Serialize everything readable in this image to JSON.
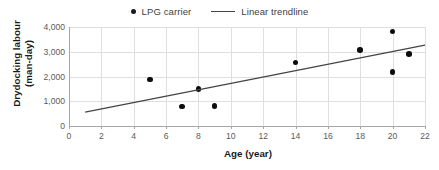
{
  "chart_data": {
    "type": "scatter",
    "title": "",
    "xlabel": "Age (year)",
    "ylabel": "Drydocking labour (man-day)",
    "ylabel_line1": "Drydocking labour",
    "ylabel_line2": "(man-day)",
    "xlim": [
      0,
      22
    ],
    "ylim": [
      0,
      4000
    ],
    "xticks": [
      0,
      2,
      4,
      6,
      8,
      10,
      12,
      14,
      16,
      18,
      20,
      22
    ],
    "xtick_labels": [
      "0",
      "2",
      "4",
      "6",
      "8",
      "10",
      "12",
      "14",
      "16",
      "18",
      "20",
      "22"
    ],
    "yticks": [
      0,
      1000,
      2000,
      3000,
      4000
    ],
    "ytick_labels": [
      "0",
      "1,000",
      "2,000",
      "3,000",
      "4,000"
    ],
    "grid": true,
    "legend_position": "top-center",
    "series": [
      {
        "name": "LPG carrier",
        "type": "scatter",
        "marker": "circle",
        "color": "#0d0d0d",
        "points": [
          {
            "x": 5,
            "y": 1880
          },
          {
            "x": 7,
            "y": 790
          },
          {
            "x": 8,
            "y": 1490
          },
          {
            "x": 9,
            "y": 800
          },
          {
            "x": 14,
            "y": 2560
          },
          {
            "x": 18,
            "y": 3060
          },
          {
            "x": 20,
            "y": 3820
          },
          {
            "x": 20,
            "y": 2190
          },
          {
            "x": 21,
            "y": 2900
          }
        ]
      },
      {
        "name": "Linear trendline",
        "type": "line",
        "color": "#444444",
        "endpoints": [
          {
            "x": 1,
            "y": 560
          },
          {
            "x": 22,
            "y": 3270
          }
        ]
      }
    ]
  },
  "legend": {
    "entries": [
      {
        "label": "LPG carrier",
        "marker": "dot"
      },
      {
        "label": "Linear trendline",
        "marker": "line"
      }
    ]
  },
  "colors": {
    "marker": "#0d0d0d",
    "trendline": "#444444",
    "grid": "#dfdfdf",
    "axis": "#a6a6a6",
    "tick_text": "#5a5a5a",
    "title_text": "#1a1a1a",
    "background": "#ffffff"
  }
}
